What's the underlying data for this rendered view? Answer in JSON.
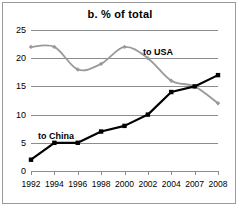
{
  "chart_data": {
    "type": "line",
    "title": "b. % of total",
    "xlabel": "",
    "ylabel": "",
    "categories": [
      "1992",
      "1994",
      "1996",
      "1998",
      "2000",
      "2002",
      "2004",
      "2007",
      "2008"
    ],
    "x_tick_labels": [
      "1992",
      "1994",
      "1996",
      "1998",
      "2000",
      "2002",
      "2004",
      "2007",
      "2008"
    ],
    "y_tick_labels": [
      "0",
      "5",
      "10",
      "15",
      "20",
      "25"
    ],
    "y_ticks": [
      0,
      5,
      10,
      15,
      20,
      25
    ],
    "ylim": [
      0,
      25
    ],
    "grid": "horizontal",
    "legend_position": "inline-annotation",
    "series": [
      {
        "name": "to USA",
        "color": "#9a9a9a",
        "marker": "diamond",
        "values": [
          22,
          22,
          18,
          19,
          22,
          20,
          16,
          15,
          12
        ]
      },
      {
        "name": "to China",
        "color": "#000000",
        "marker": "square",
        "values": [
          2,
          5,
          5,
          7,
          8,
          10,
          14,
          15,
          17
        ]
      }
    ],
    "annotations": [
      {
        "text": "to USA",
        "series": "to USA"
      },
      {
        "text": "to China",
        "series": "to China"
      }
    ]
  },
  "colors": {
    "usa_line": "#9a9a9a",
    "china_line": "#000000",
    "gridline": "#8c8c8c",
    "frame": "#9a9a9a",
    "background": "#ffffff"
  }
}
